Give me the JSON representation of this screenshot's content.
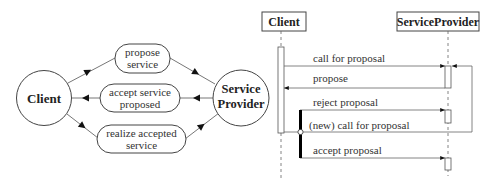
{
  "interaction_diagram": {
    "client_label": "Client",
    "provider_label_line1": "Service",
    "provider_label_line2": "Provider",
    "edges": [
      {
        "line1": "propose",
        "line2": "service"
      },
      {
        "line1": "accept service",
        "line2": "proposed"
      },
      {
        "line1": "realize accepted",
        "line2": "service"
      }
    ]
  },
  "sequence_diagram": {
    "lifelines": [
      {
        "label": "Client"
      },
      {
        "label": "ServiceProvider"
      }
    ],
    "messages": [
      {
        "label": "call for proposal"
      },
      {
        "label": "propose"
      },
      {
        "label": "reject proposal"
      },
      {
        "label": "(new) call for proposal"
      },
      {
        "label": "accept proposal"
      }
    ]
  },
  "colors": {
    "stroke": "#444444",
    "thin_line": "#777777",
    "bar": "#000000"
  }
}
